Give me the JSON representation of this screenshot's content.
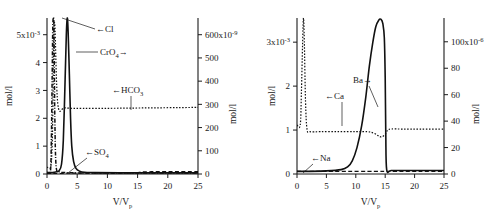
{
  "figure": {
    "panels": [
      {
        "id": "left",
        "x_axis": {
          "label_main": "V/V",
          "label_sub": "p",
          "ticks": [
            0,
            5,
            10,
            15,
            20,
            25
          ],
          "min": 0,
          "max": 25
        },
        "y_axis_left": {
          "label": "mol/l",
          "ticks": [
            0,
            1,
            2,
            3,
            4,
            5
          ],
          "top_tick_text": "5x10",
          "top_tick_exponent": "-3",
          "min": 0,
          "max": 5.6
        },
        "y_axis_right": {
          "label": "mol/l",
          "ticks": [
            0,
            100,
            200,
            300,
            400,
            500,
            600
          ],
          "top_tick_text": "600x10",
          "top_tick_exponent": "-9",
          "min": 0,
          "max": 672
        },
        "annotations": [
          {
            "name": "cl-label",
            "text": "←Cl",
            "x": 96,
            "y": 29
          },
          {
            "name": "cro4-label",
            "text": "CrO",
            "sub": "4",
            "arrow": "→",
            "x": 100,
            "y": 52
          },
          {
            "name": "hco3-label",
            "text": "←HCO",
            "sub": "3",
            "x": 112,
            "y": 90
          },
          {
            "name": "so4-label",
            "text": "←SO",
            "sub": "4",
            "x": 85,
            "y": 152
          }
        ]
      },
      {
        "id": "right",
        "x_axis": {
          "label_main": "V/V",
          "label_sub": "p",
          "ticks": [
            0,
            5,
            10,
            15,
            20,
            25
          ],
          "min": 0,
          "max": 25
        },
        "y_axis_left": {
          "label": "mol/l",
          "ticks": [
            0,
            1,
            2,
            3
          ],
          "top_tick_text": "3x10",
          "top_tick_exponent": "-3",
          "min": 0,
          "max": 3.55
        },
        "y_axis_right": {
          "label": "mol/l",
          "ticks": [
            0,
            20,
            40,
            60,
            80,
            100
          ],
          "top_tick_text": "100x10",
          "top_tick_exponent": "-6",
          "min": 0,
          "max": 118
        },
        "annotations": [
          {
            "name": "ca-label",
            "text": "←Ca",
            "x": 325,
            "y": 96
          },
          {
            "name": "ba-label",
            "text": "Ba",
            "arrow": "→",
            "x": 353,
            "y": 80
          },
          {
            "name": "na-label",
            "text": "←Na",
            "x": 311,
            "y": 158
          }
        ]
      }
    ]
  },
  "chart_data": [
    {
      "type": "line",
      "panel": "left",
      "title": "",
      "xlabel": "V/Vp",
      "ylabel": "mol/l",
      "xlim": [
        0,
        25
      ],
      "ylim": [
        0,
        5.6
      ],
      "y2lim": [
        0,
        672
      ],
      "ylabel_scale": "5x10^-3",
      "y2label_scale": "600x10^-9",
      "grid": false,
      "legend": "inline-annotations",
      "xticks": [
        0,
        5,
        10,
        15,
        20,
        25
      ],
      "yticks": [
        0,
        1,
        2,
        3,
        4,
        5
      ],
      "y2ticks": [
        0,
        100,
        200,
        300,
        400,
        500,
        600
      ],
      "series": [
        {
          "name": "Cl",
          "style": "dash-dot",
          "axis": "left",
          "x": [
            0.0,
            0.55,
            0.72,
            0.85,
            0.95,
            1.05,
            1.15,
            1.3,
            1.5,
            2.0,
            3.0,
            5.0,
            10.0,
            15.0,
            20.0,
            25.0
          ],
          "y": [
            0.06,
            0.06,
            1.2,
            3.4,
            5.2,
            5.6,
            5.2,
            2.0,
            0.3,
            0.08,
            0.05,
            0.04,
            0.04,
            0.04,
            0.04,
            0.04
          ]
        },
        {
          "name": "CrO4",
          "style": "solid",
          "axis": "left",
          "x": [
            0.0,
            0.8,
            1.2,
            1.6,
            2.0,
            2.4,
            2.7,
            3.0,
            3.2,
            3.35,
            3.5,
            3.7,
            3.9,
            4.1,
            4.4,
            4.8,
            5.4,
            6.2,
            8.0,
            12.0,
            18.0,
            25.0
          ],
          "y": [
            0.05,
            0.05,
            0.06,
            0.08,
            0.12,
            0.35,
            1.2,
            3.4,
            5.0,
            5.6,
            5.1,
            3.6,
            2.0,
            1.0,
            0.45,
            0.2,
            0.1,
            0.06,
            0.05,
            0.04,
            0.04,
            0.04
          ]
        },
        {
          "name": "HCO3",
          "style": "dotted",
          "axis": "right",
          "x": [
            0.0,
            0.6,
            0.85,
            1.0,
            1.1,
            1.3,
            1.8,
            3.0,
            6.0,
            10.0,
            14.0,
            18.0,
            22.0,
            25.0
          ],
          "y": [
            30,
            30,
            120,
            330,
            560,
            640,
            300,
            285,
            283,
            283,
            284,
            285,
            286,
            287
          ]
        },
        {
          "name": "SO4",
          "style": "dashed",
          "axis": "right",
          "x": [
            0.0,
            0.8,
            1.2,
            2.0,
            3.0,
            4.0,
            6.0,
            9.0,
            12.0,
            14.5,
            16.0,
            18.0,
            20.0,
            22.0,
            24.0,
            25.0
          ],
          "y": [
            2,
            2,
            2,
            2,
            3,
            4,
            4,
            4,
            4,
            5,
            9,
            10,
            10,
            10,
            10,
            10
          ]
        }
      ]
    },
    {
      "type": "line",
      "panel": "right",
      "title": "",
      "xlabel": "V/Vp",
      "ylabel": "mol/l",
      "xlim": [
        0,
        25
      ],
      "ylim": [
        0,
        3.55
      ],
      "y2lim": [
        0,
        118
      ],
      "ylabel_scale": "3x10^-3",
      "y2label_scale": "100x10^-6",
      "grid": false,
      "legend": "inline-annotations",
      "xticks": [
        0,
        5,
        10,
        15,
        20,
        25
      ],
      "yticks": [
        0,
        1,
        2,
        3
      ],
      "y2ticks": [
        0,
        20,
        40,
        60,
        80,
        100
      ],
      "series": [
        {
          "name": "Ca",
          "style": "dotted",
          "axis": "right",
          "x": [
            0.0,
            0.55,
            0.75,
            0.95,
            1.1,
            1.25,
            1.45,
            1.7,
            2.2,
            4.0,
            7.0,
            10.0,
            12.0,
            13.0,
            13.8,
            14.4,
            15.0,
            15.4,
            16.0,
            18.0,
            21.0,
            25.0
          ],
          "y": [
            37,
            37,
            62,
            98,
            118,
            100,
            55,
            34,
            32,
            32,
            32,
            32,
            32,
            31,
            29,
            28,
            30,
            33,
            34,
            34,
            34,
            34
          ]
        },
        {
          "name": "Ba",
          "style": "solid",
          "axis": "left",
          "x": [
            0.0,
            2.0,
            5.0,
            7.5,
            8.6,
            9.4,
            10.2,
            11.0,
            11.7,
            12.3,
            12.9,
            13.4,
            13.9,
            14.3,
            14.6,
            14.85,
            15.0,
            15.1,
            15.25,
            16.0,
            18.0,
            21.0,
            25.0
          ],
          "y": [
            0.06,
            0.06,
            0.07,
            0.1,
            0.16,
            0.3,
            0.6,
            1.1,
            1.75,
            2.45,
            3.0,
            3.35,
            3.5,
            3.52,
            3.42,
            3.1,
            2.2,
            0.9,
            0.1,
            0.08,
            0.08,
            0.08,
            0.08
          ]
        },
        {
          "name": "Na",
          "style": "dashed",
          "axis": "right",
          "x": [
            0.0,
            1.0,
            2.0,
            4.0,
            6.0,
            9.0,
            12.0,
            14.0,
            15.0,
            16.0,
            18.0,
            20.0,
            22.0,
            25.0
          ],
          "y": [
            2,
            2,
            2,
            2,
            2,
            2,
            2,
            2,
            2,
            2,
            2,
            2,
            2,
            2
          ]
        }
      ]
    }
  ]
}
